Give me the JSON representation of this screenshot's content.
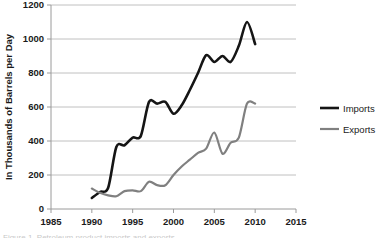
{
  "chart_data": {
    "type": "line",
    "title": "",
    "subtitle": "",
    "xlabel": "",
    "ylabel": "In Thousands of Barrels per Day",
    "xlim": [
      1985,
      2015
    ],
    "ylim": [
      0,
      1200
    ],
    "xticks": [
      1985,
      1990,
      1995,
      2000,
      2005,
      2010,
      2015
    ],
    "xtick_labels": [
      "1985",
      "1990",
      "1995",
      "2000",
      "2005",
      "2010",
      "2015"
    ],
    "yticks": [
      0,
      200,
      400,
      600,
      800,
      1000,
      1200
    ],
    "ytick_labels": [
      "0",
      "200",
      "400",
      "600",
      "800",
      "1000",
      "1200"
    ],
    "grid": "horizontal",
    "legend_position": "right",
    "x": [
      1990,
      1991,
      1992,
      1993,
      1994,
      1995,
      1996,
      1997,
      1998,
      1999,
      2000,
      2001,
      2002,
      2003,
      2004,
      2005,
      2006,
      2007,
      2008,
      2009,
      2010
    ],
    "series": [
      {
        "name": "Imports",
        "color": "#151515",
        "line_width": 2.6,
        "values": [
          65,
          100,
          125,
          365,
          375,
          420,
          430,
          630,
          620,
          630,
          560,
          610,
          700,
          800,
          905,
          865,
          900,
          865,
          960,
          1100,
          970
        ]
      },
      {
        "name": "Exports",
        "color": "#808080",
        "line_width": 2.2,
        "values": [
          120,
          95,
          80,
          75,
          105,
          110,
          105,
          160,
          140,
          140,
          200,
          250,
          290,
          330,
          355,
          450,
          325,
          390,
          420,
          620,
          620
        ]
      }
    ]
  },
  "legend": {
    "items": [
      {
        "label": "Imports",
        "color": "#151515"
      },
      {
        "label": "Exports",
        "color": "#808080"
      }
    ]
  },
  "bottom_caption": "Figure 1. Petroleum product imports and exports"
}
